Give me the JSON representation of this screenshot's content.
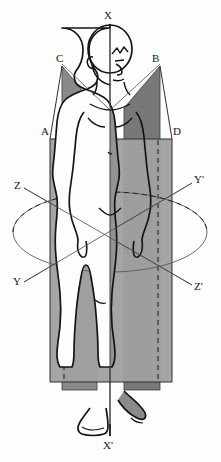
{
  "running_head": {
    "page_number": "272",
    "title": "FUNCTIONAL ANATOMY OF THE S"
  },
  "figure": {
    "caption": "",
    "colors": {
      "ink": "#151515",
      "plane_fill_left": "#8c8c8c",
      "plane_fill_right": "#7a7a7a",
      "plane_fill_front": "#a2a2a2",
      "paper": "#fefefe",
      "thin_line": "#6f6f6f"
    }
  },
  "labels": {
    "x_top": "X",
    "x_bottom": "X'",
    "plane_a": "A",
    "plane_b": "B",
    "plane_c": "C",
    "plane_d": "D",
    "z_left": "Z",
    "z_right": "Z'",
    "y_left": "Y",
    "y_right": "Y'"
  },
  "label_positions": {
    "x_top": {
      "x": 104,
      "y": 16
    },
    "x_bottom": {
      "x": 103,
      "y": 440
    },
    "plane_c": {
      "x": 56,
      "y": 58
    },
    "plane_b": {
      "x": 152,
      "y": 58
    },
    "plane_a": {
      "x": 41,
      "y": 128
    },
    "plane_d": {
      "x": 173,
      "y": 128
    },
    "z_left": {
      "x": 15,
      "y": 181
    },
    "y_right": {
      "x": 194,
      "y": 176
    },
    "y_left": {
      "x": 14,
      "y": 277
    },
    "z_right": {
      "x": 194,
      "y": 281
    }
  }
}
